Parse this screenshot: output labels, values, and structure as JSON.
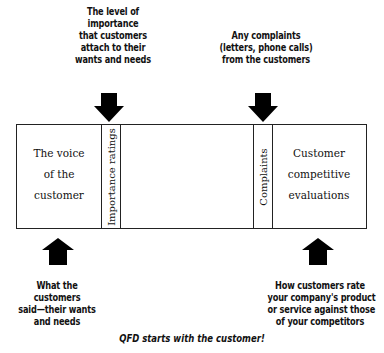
{
  "diagram": {
    "title_caption": "QFD starts with the customer!",
    "top_notes": {
      "importance": "The level of\nimportance\nthat customers\nattach to their\nwants and needs",
      "complaints": "Any complaints\n(letters, phone calls)\nfrom the customers"
    },
    "bottom_notes": {
      "voice": "What the\ncustomers\nsaid—their wants\nand needs",
      "competitive": "How customers rate\nyour company's product\nor service against those\nof your competitors"
    },
    "box": {
      "voice_cell": "The voice\nof the\ncustomer",
      "importance_column": "Importance ratings",
      "complaints_column": "Complaints",
      "competitive_cell": "Customer\ncompetitive\nevaluations"
    },
    "arrows": [
      {
        "direction": "down",
        "target": "Importance ratings"
      },
      {
        "direction": "down",
        "target": "Complaints"
      },
      {
        "direction": "up",
        "source": "The voice of the customer"
      },
      {
        "direction": "up",
        "source": "Customer competitive evaluations"
      }
    ],
    "colors": {
      "ink": "#111111",
      "background": "#ffffff"
    }
  }
}
